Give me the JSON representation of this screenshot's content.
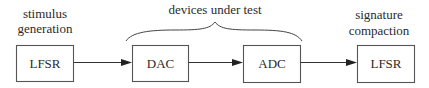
{
  "diagram": {
    "annotations": {
      "left": [
        "stimulus",
        "generation"
      ],
      "top": "devices under test",
      "right": [
        "signature",
        "compaction"
      ]
    },
    "blocks": [
      {
        "id": "lfsr-generator",
        "label": "LFSR"
      },
      {
        "id": "dac",
        "label": "DAC"
      },
      {
        "id": "adc",
        "label": "ADC"
      },
      {
        "id": "lfsr-compactor",
        "label": "LFSR"
      }
    ],
    "edges": [
      {
        "from": "lfsr-generator",
        "to": "dac"
      },
      {
        "from": "dac",
        "to": "adc"
      },
      {
        "from": "adc",
        "to": "lfsr-compactor"
      }
    ],
    "colors": {
      "stroke": "#555555",
      "text": "#2a2a2a",
      "background": "#ffffff"
    }
  }
}
